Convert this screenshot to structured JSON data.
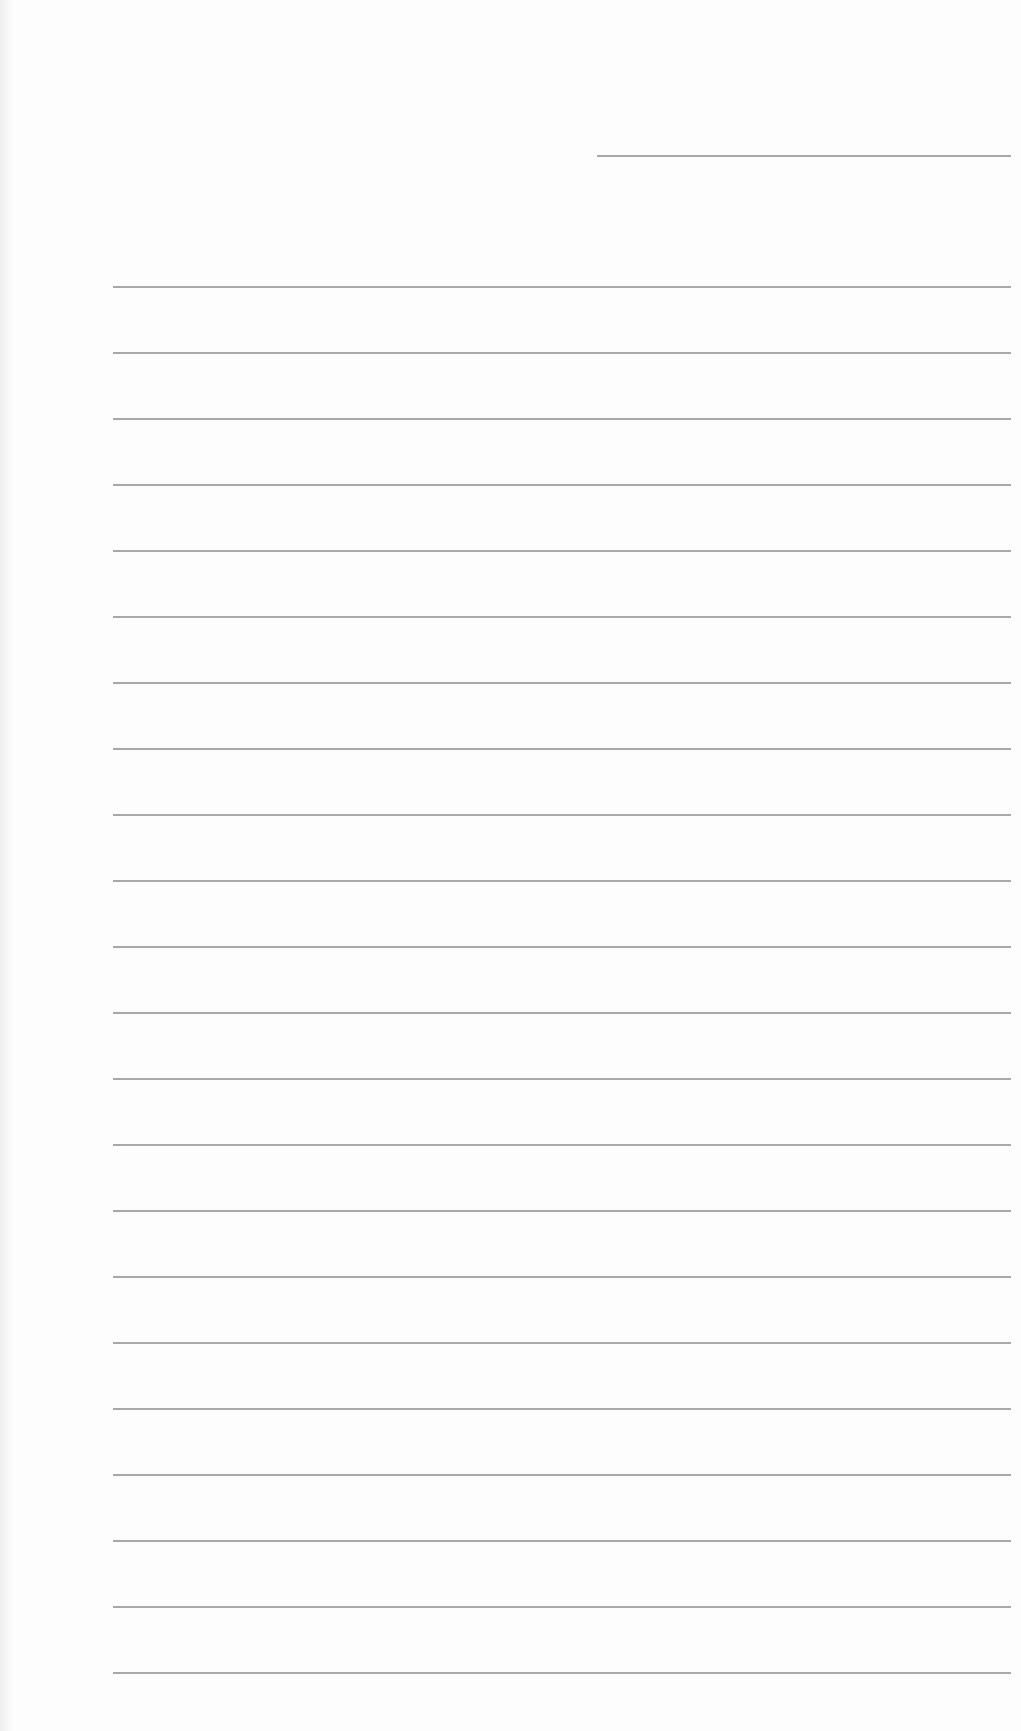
{
  "page": {
    "type": "lined paper",
    "background_color": "#fdfdfd",
    "line_color": "#a8a8a8",
    "header_line": {
      "present": true
    },
    "ruled_lines": {
      "count": 22,
      "first_y": 286,
      "spacing": 66
    }
  }
}
